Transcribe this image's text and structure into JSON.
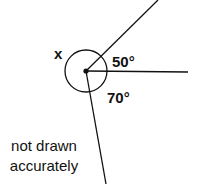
{
  "diagram": {
    "center": {
      "x": 86,
      "y": 71
    },
    "circle_radius": 21,
    "rays": [
      {
        "name": "ray-upper-right",
        "x2": 158,
        "y2": 0
      },
      {
        "name": "ray-right",
        "x2": 188,
        "y2": 72
      },
      {
        "name": "ray-down",
        "x2": 106,
        "y2": 184
      }
    ],
    "labels": {
      "unknown_angle": "x",
      "angle_a": "50°",
      "angle_b": "70°",
      "note_line1": "not drawn",
      "note_line2": "accurately"
    },
    "colors": {
      "stroke": "#111111",
      "background": "#ffffff"
    }
  }
}
